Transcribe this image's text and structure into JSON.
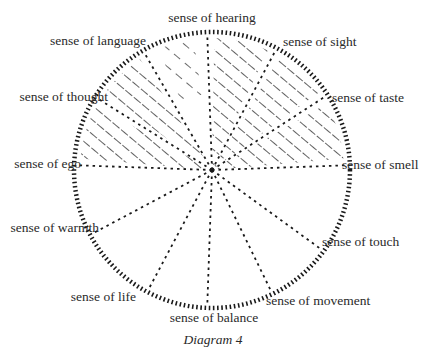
{
  "diagram": {
    "title": "Diagram 4",
    "shape": "circle divided into twelve sectors by dashed radii",
    "ink_color": "#1a1a1a",
    "background_color": "#ffffff",
    "center": [
      212,
      170
    ],
    "radius": 138,
    "senses": [
      {
        "id": "hearing",
        "label": "sense of hearing",
        "angle_deg": -92,
        "label_pos": [
          212,
          22
        ],
        "anchor": "middle"
      },
      {
        "id": "sight",
        "label": "sense of sight",
        "angle_deg": -62,
        "label_pos": [
          283,
          46
        ],
        "anchor": "start"
      },
      {
        "id": "taste",
        "label": "sense of taste",
        "angle_deg": -33,
        "label_pos": [
          332,
          102
        ],
        "anchor": "start"
      },
      {
        "id": "smell",
        "label": "sense of smell",
        "angle_deg": -2,
        "label_pos": [
          342,
          169
        ],
        "anchor": "start"
      },
      {
        "id": "touch",
        "label": "sense of touch",
        "angle_deg": 36,
        "label_pos": [
          322,
          246
        ],
        "anchor": "start"
      },
      {
        "id": "movement",
        "label": "sense of movement",
        "angle_deg": 64,
        "label_pos": [
          266,
          305
        ],
        "anchor": "start"
      },
      {
        "id": "balance",
        "label": "sense of balance",
        "angle_deg": 92,
        "label_pos": [
          214,
          322
        ],
        "anchor": "middle"
      },
      {
        "id": "life",
        "label": "sense of life",
        "angle_deg": 118,
        "label_pos": [
          136,
          301
        ],
        "anchor": "end"
      },
      {
        "id": "warmth",
        "label": "sense of warmth",
        "angle_deg": 152,
        "label_pos": [
          99,
          232
        ],
        "anchor": "end"
      },
      {
        "id": "ego",
        "label": "sense of ego",
        "angle_deg": 182,
        "label_pos": [
          81,
          168
        ],
        "anchor": "end"
      },
      {
        "id": "thought",
        "label": "sense of thought",
        "angle_deg": 212,
        "label_pos": [
          108,
          101
        ],
        "anchor": "end"
      },
      {
        "id": "language",
        "label": "sense of language",
        "angle_deg": 240,
        "label_pos": [
          146,
          45
        ],
        "anchor": "end"
      }
    ],
    "hatched_sectors": [
      [
        "ego",
        "thought"
      ],
      [
        "thought",
        "language"
      ],
      [
        "hearing",
        "sight"
      ],
      [
        "sight",
        "taste"
      ],
      [
        "taste",
        "smell"
      ]
    ],
    "partially_hatched_sectors": [
      [
        "language",
        "hearing"
      ]
    ],
    "caption": "Diagram 4"
  }
}
